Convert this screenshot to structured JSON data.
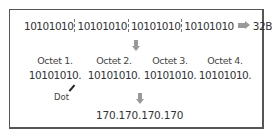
{
  "binary_row": {
    "segments": [
      "10101010",
      "10101010",
      "10101010",
      "10101010"
    ],
    "result_label": "32Bit (IP)"
  },
  "octets": [
    {
      "label": "Octet 1.",
      "value": "10101010."
    },
    {
      "label": "Octet 2.",
      "value": "10101010."
    },
    {
      "label": "Octet 3.",
      "value": "10101010."
    },
    {
      "label": "Octet 4.",
      "value": "10101010."
    }
  ],
  "annotation": {
    "dot_label": "Dot"
  },
  "decimal_ip": "170.170.170.170",
  "colors": {
    "border": "#555555",
    "arrow": "#999999",
    "text": "#333333"
  }
}
